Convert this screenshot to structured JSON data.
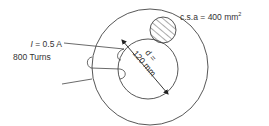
{
  "diagram": {
    "labels": {
      "current_symbol": "I",
      "current_value": " = 0.5 A",
      "turns": "800 Turns",
      "csa": "c.s.a = 400 mm",
      "csa_superscript": "2",
      "diameter_symbol": "d =",
      "diameter_value": "120 mm"
    },
    "colors": {
      "stroke": "#444444",
      "text": "#333333",
      "background": "#ffffff"
    }
  }
}
